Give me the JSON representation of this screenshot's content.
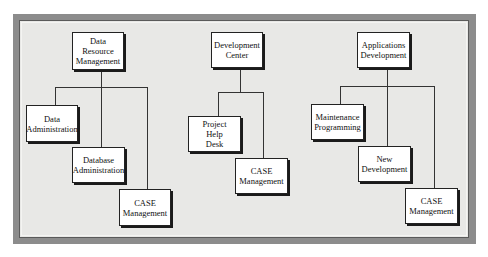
{
  "diagram": {
    "type": "organization-chart",
    "groups": [
      {
        "root": {
          "label": "Data\nResource\nManagement"
        },
        "children": [
          {
            "label": "Data\nAdministration"
          },
          {
            "label": "Database\nAdministration"
          },
          {
            "label": "CASE\nManagement"
          }
        ]
      },
      {
        "root": {
          "label": "Development\nCenter"
        },
        "children": [
          {
            "label": "Project\nHelp\nDesk"
          },
          {
            "label": "CASE\nManagement"
          }
        ]
      },
      {
        "root": {
          "label": "Applications\nDevelopment"
        },
        "children": [
          {
            "label": "Maintenance\nProgramming"
          },
          {
            "label": "New\nDevelopment"
          },
          {
            "label": "CASE\nManagement"
          }
        ]
      }
    ]
  },
  "colors": {
    "page_background": "#ffffff",
    "frame": "#8c8c8c",
    "panel": "#e8e8e6",
    "box_fill": "#ffffff",
    "line": "#333333"
  }
}
